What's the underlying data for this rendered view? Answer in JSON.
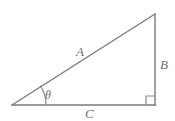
{
  "figure": {
    "name": "right-triangle-diagram",
    "background_color": "#ffffff",
    "stroke_color": "#7a7a7a",
    "label_color": "#6f6f6f",
    "stroke_width": 1.4,
    "vertices": {
      "angle_vertex": {
        "x": 12,
        "y": 105
      },
      "right_angle_vertex": {
        "x": 155,
        "y": 105
      },
      "apex_vertex": {
        "x": 155,
        "y": 14
      }
    },
    "sides": {
      "hypotenuse": {
        "label": "A",
        "from": "angle_vertex",
        "to": "apex_vertex"
      },
      "opposite": {
        "label": "B",
        "from": "apex_vertex",
        "to": "right_angle_vertex"
      },
      "adjacent": {
        "label": "C",
        "from": "right_angle_vertex",
        "to": "angle_vertex"
      }
    },
    "angle": {
      "label": "θ",
      "arc_radius": 34,
      "at_vertex": "angle_vertex"
    },
    "right_angle_marker": {
      "name": "right-angle-square",
      "size": 9
    }
  }
}
